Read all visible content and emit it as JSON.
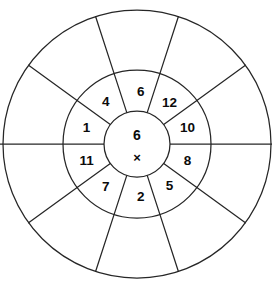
{
  "worksheet": {
    "type": "multiplication-wheel",
    "title": "Multiplication Wheel",
    "center": {
      "factor": "6",
      "operator": "×"
    },
    "geometry": {
      "center_x": 137,
      "center_y": 144,
      "inner_radius": 33,
      "middle_radius": 74,
      "outer_radius": 134,
      "axis_line_y": 144,
      "axis_line_x1": 0,
      "axis_line_x2": 272,
      "stroke_color": "#262626",
      "fill_color": "#ffffff",
      "text_color": "#0b0b0b"
    },
    "inner_ring": {
      "sector_count": 10,
      "label_radius": 53,
      "sectors": [
        {
          "label": "6",
          "angle_start": -108,
          "angle_end": -72,
          "label_angle": -86
        },
        {
          "label": "12",
          "angle_start": -72,
          "angle_end": -36,
          "label_angle": -52
        },
        {
          "label": "10",
          "angle_start": -36,
          "angle_end": 0,
          "label_angle": -18
        },
        {
          "label": "8",
          "angle_start": 0,
          "angle_end": 36,
          "label_angle": 18
        },
        {
          "label": "5",
          "angle_start": 36,
          "angle_end": 72,
          "label_angle": 52
        },
        {
          "label": "2",
          "angle_start": 72,
          "angle_end": 108,
          "label_angle": 86
        },
        {
          "label": "7",
          "angle_start": 108,
          "angle_end": 144,
          "label_angle": 126
        },
        {
          "label": "11",
          "angle_start": 144,
          "angle_end": 180,
          "label_angle": 162
        },
        {
          "label": "1",
          "angle_start": 180,
          "angle_end": 216,
          "label_angle": 198
        },
        {
          "label": "4",
          "angle_start": 216,
          "angle_end": 252,
          "label_angle": 234
        }
      ]
    },
    "outer_ring": {
      "sector_count": 10,
      "answer_slots": [
        {
          "for": "6",
          "value": "",
          "angle_start": -108,
          "angle_end": -72
        },
        {
          "for": "12",
          "value": "",
          "angle_start": -72,
          "angle_end": -36
        },
        {
          "for": "10",
          "value": "",
          "angle_start": -36,
          "angle_end": 0
        },
        {
          "for": "8",
          "value": "",
          "angle_start": 0,
          "angle_end": 36
        },
        {
          "for": "5",
          "value": "",
          "angle_start": 36,
          "angle_end": 72
        },
        {
          "for": "2",
          "value": "",
          "angle_start": 72,
          "angle_end": 108
        },
        {
          "for": "7",
          "value": "",
          "angle_start": 108,
          "angle_end": 144
        },
        {
          "for": "11",
          "value": "",
          "angle_start": 144,
          "angle_end": 180
        },
        {
          "for": "1",
          "value": "",
          "angle_start": 180,
          "angle_end": 216
        },
        {
          "for": "4",
          "value": "",
          "angle_start": 216,
          "angle_end": 252
        }
      ]
    }
  }
}
